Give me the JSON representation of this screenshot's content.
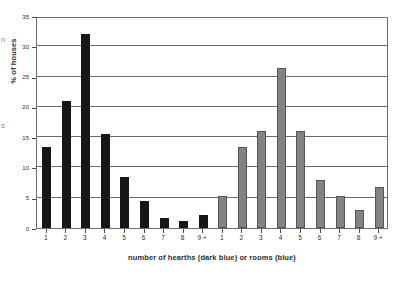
{
  "chart_data": {
    "type": "bar",
    "title": "",
    "xlabel": "number of hearths (dark blue) or rooms (blue)",
    "ylabel": "% of houses",
    "ylim": [
      0,
      35
    ],
    "ytick_step": 5,
    "yticks": [
      "0",
      "5",
      "10",
      "15",
      "20",
      "25",
      "30",
      "35"
    ],
    "grid": "horizontal",
    "legend": "none",
    "categories": [
      "1",
      "2",
      "3",
      "4",
      "5",
      "6",
      "7",
      "8",
      "9 +"
    ],
    "series": [
      {
        "name": "number of hearths (dark blue)",
        "color": "#161616",
        "values": [
          13.3,
          21.0,
          32.0,
          15.5,
          8.5,
          4.4,
          1.7,
          1.2,
          2.2
        ]
      },
      {
        "name": "rooms (blue)",
        "color": "#838383",
        "values": [
          5.3,
          13.3,
          16.0,
          26.5,
          16.0,
          8.0,
          5.3,
          3.0,
          6.7
        ]
      }
    ],
    "xtick_labels": [
      "1",
      "2",
      "3",
      "4",
      "5",
      "6",
      "7",
      "8",
      "9 +",
      "1",
      "2",
      "3",
      "4",
      "5",
      "6",
      "7",
      "8",
      "9 +"
    ]
  },
  "edge_fragments": [
    "n",
    "s"
  ]
}
